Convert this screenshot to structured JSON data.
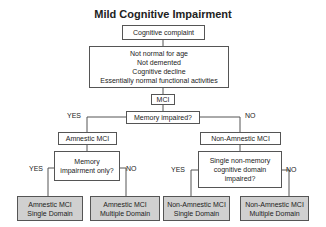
{
  "title": "Mild Cognitive Impairment",
  "nodes": {
    "complaint": "Cognitive complaint",
    "criteria": [
      "Not normal for age",
      "Not demented",
      "Cognitive decline",
      "Essentially normal functional activities"
    ],
    "mci": "MCI",
    "memory_impaired": "Memory impaired?",
    "amnestic": "Amnestic MCI",
    "non_amnestic": "Non-Amnestic MCI",
    "memory_only": [
      "Memory",
      "impairment only?"
    ],
    "single_non_memory": [
      "Single non-memory",
      "cognitive domain",
      "impaired?"
    ],
    "leaf_a_single": [
      "Amnestic MCI",
      "Single Domain"
    ],
    "leaf_a_multi": [
      "Amnestic MCI",
      "Multiple Domain"
    ],
    "leaf_na_single": [
      "Non-Amnestic MCI",
      "Single Domain"
    ],
    "leaf_na_multi": [
      "Non-Amnestic MCI",
      "Multiple Domain"
    ]
  },
  "labels": {
    "yes": "YES",
    "no": "NO"
  }
}
